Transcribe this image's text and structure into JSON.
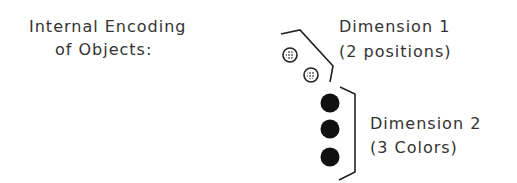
{
  "title": {
    "line1": "Internal Encoding",
    "line2": "of Objects:"
  },
  "dimension1": {
    "line1": "Dimension 1",
    "line2": "(2 positions)",
    "marker_style": "stippled-ring",
    "count": 2
  },
  "dimension2": {
    "line1": "Dimension 2",
    "line2": "(3 Colors)",
    "marker_style": "solid-black",
    "count": 3
  },
  "colors": {
    "ink": "#222222",
    "text": "#333333",
    "background": "#ffffff"
  }
}
